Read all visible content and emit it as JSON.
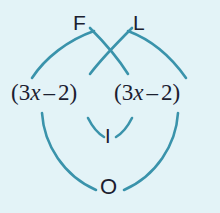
{
  "figure": {
    "name": "foil-method-diagram",
    "background_color": "#e3f3f7",
    "arc_color": "#3a93ab",
    "text_color": "#1b2030"
  },
  "expression": {
    "left_binomial": {
      "open_paren": "(",
      "coefficient": "3",
      "variable": "x",
      "operator": "–",
      "constant": "2",
      "close_paren": ")",
      "full_text": "(3x – 2)"
    },
    "right_binomial": {
      "open_paren": "(",
      "coefficient": "3",
      "variable": "x",
      "operator": "–",
      "constant": "2",
      "close_paren": ")",
      "full_text": "(3x – 2)"
    }
  },
  "foil_labels": {
    "first": "F",
    "outer": "O",
    "inner": "I",
    "last": "L"
  },
  "arcs": [
    {
      "name": "first-arc",
      "label": "F",
      "from": "left-first-term",
      "to": "right-first-term"
    },
    {
      "name": "outer-arc",
      "label": "O",
      "from": "left-first-term",
      "to": "right-last-term"
    },
    {
      "name": "inner-arc",
      "label": "I",
      "from": "left-last-term",
      "to": "right-first-term"
    },
    {
      "name": "last-arc",
      "label": "L",
      "from": "left-last-term",
      "to": "right-last-term"
    }
  ]
}
